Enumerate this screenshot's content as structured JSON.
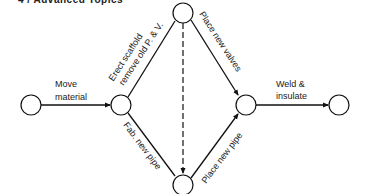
{
  "header": {
    "text": "4 / Advanced Topics"
  },
  "diagram": {
    "type": "activity-on-arrow network",
    "nodes": [
      {
        "id": "n1",
        "cx": 31,
        "cy": 105
      },
      {
        "id": "n2",
        "cx": 121,
        "cy": 105
      },
      {
        "id": "n3",
        "cx": 183,
        "cy": 13
      },
      {
        "id": "n4",
        "cx": 183,
        "cy": 185
      },
      {
        "id": "n5",
        "cx": 246,
        "cy": 105
      },
      {
        "id": "n6",
        "cx": 339,
        "cy": 105
      }
    ],
    "activities": {
      "move_material": {
        "line1": "Move",
        "line2": "material"
      },
      "erect_scaffold": {
        "line1": "Erect scaffold",
        "line2": "remove old P. & V."
      },
      "fab_new_pipe": {
        "line1": "Fab. new pipe"
      },
      "place_new_valves": {
        "line1": "Place new valves"
      },
      "place_new_pipe": {
        "line1": "Place new pipe"
      },
      "weld_insulate": {
        "line1": "Weld &",
        "line2": "insulate"
      }
    },
    "dummy": {
      "from": "n3",
      "to": "n4",
      "style": "dashed"
    }
  }
}
